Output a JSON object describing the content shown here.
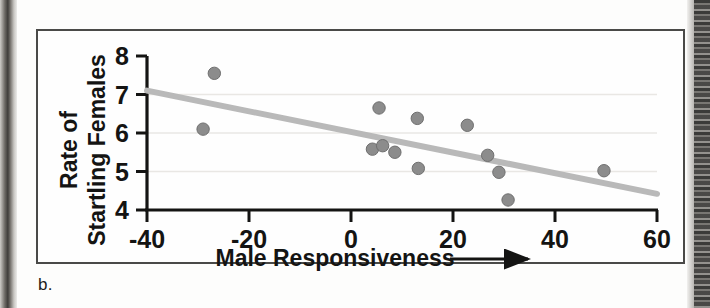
{
  "panel": {
    "label": "b."
  },
  "chart_data": {
    "type": "scatter",
    "title": "",
    "xlabel": "Male Responsiveness",
    "xlabel_suffix_icon": "right-arrow",
    "ylabel_line1": "Rate of",
    "ylabel_line2": "Startling Females",
    "xlim": [
      -40,
      60
    ],
    "ylim": [
      4,
      8
    ],
    "xticks": [
      -40,
      -20,
      0,
      20,
      40,
      60
    ],
    "xtick_labels": [
      "-40",
      "-20",
      "0",
      "20",
      "40",
      "60"
    ],
    "yticks": [
      4,
      5,
      6,
      7,
      8
    ],
    "ytick_labels": [
      "4",
      "5",
      "6",
      "7",
      "8"
    ],
    "grid": "horizontal-light",
    "legend": null,
    "point_color": "#8c8c8c",
    "point_edge_color": "#6f6f6f",
    "trendline_color": "#b9b9b9",
    "axis_color": "#141413",
    "points": [
      {
        "x": -29.0,
        "y": 6.1
      },
      {
        "x": -26.8,
        "y": 7.55
      },
      {
        "x": 4.2,
        "y": 5.58
      },
      {
        "x": 5.5,
        "y": 6.65
      },
      {
        "x": 6.2,
        "y": 5.67
      },
      {
        "x": 8.6,
        "y": 5.5
      },
      {
        "x": 13.0,
        "y": 6.38
      },
      {
        "x": 13.2,
        "y": 5.08
      },
      {
        "x": 22.8,
        "y": 6.2
      },
      {
        "x": 26.8,
        "y": 5.42
      },
      {
        "x": 29.0,
        "y": 4.98
      },
      {
        "x": 30.8,
        "y": 4.26
      },
      {
        "x": 49.6,
        "y": 5.02
      }
    ],
    "trendline": {
      "x0": -40,
      "y0": 7.1,
      "x1": 60,
      "y1": 4.42
    }
  }
}
